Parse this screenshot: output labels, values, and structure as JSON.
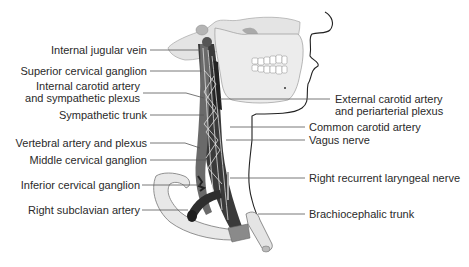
{
  "figure": {
    "labels_left": [
      {
        "id": "internal-jugular-vein",
        "text": "Internal jugular vein",
        "y": 44
      },
      {
        "id": "superior-cervical-ganglion",
        "text": "Superior cervical ganglion",
        "y": 65
      },
      {
        "id": "internal-carotid-artery",
        "line1": "Internal carotid artery",
        "line2": "and sympathetic plexus",
        "y": 81
      },
      {
        "id": "sympathetic-trunk",
        "text": "Sympathetic trunk",
        "y": 109
      },
      {
        "id": "vertebral-artery",
        "text": "Vertebral artery and plexus",
        "y": 137
      },
      {
        "id": "middle-cervical-ganglion",
        "text": "Middle cervical ganglion",
        "y": 154
      },
      {
        "id": "inferior-cervical-ganglion",
        "text": "Inferior cervical ganglion",
        "y": 179
      },
      {
        "id": "right-subclavian-artery",
        "text": "Right subclavian artery",
        "y": 204
      }
    ],
    "labels_right": [
      {
        "id": "external-carotid-artery",
        "line1": "External carotid artery",
        "line2": "and periarterial plexus",
        "y": 93
      },
      {
        "id": "common-carotid-artery",
        "text": "Common carotid artery",
        "y": 121
      },
      {
        "id": "vagus-nerve",
        "text": "Vagus nerve",
        "y": 135
      },
      {
        "id": "right-recurrent-laryngeal-nerve",
        "text": "Right recurrent laryngeal nerve",
        "y": 173
      },
      {
        "id": "brachiocephalic-trunk",
        "text": "Brachiocephalic trunk",
        "y": 210
      }
    ],
    "colors": {
      "bone": "#e6e6e6",
      "bone_shade": "#bdbdbd",
      "vessel_dark": "#3a3a3a",
      "nerve_light": "#d8d8d8",
      "leader_line": "#555555",
      "outline": "#222222",
      "cartilage": "#8a8a8a"
    }
  }
}
